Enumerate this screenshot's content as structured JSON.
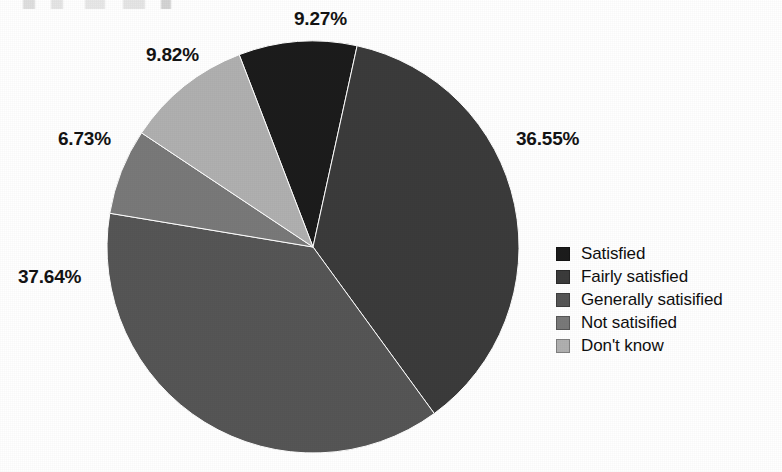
{
  "chart_data": {
    "type": "pie",
    "title": "",
    "subtitle": "",
    "xlabel": "",
    "ylabel": "",
    "grid": false,
    "legend_position": "right",
    "start_angle_deg": -21,
    "direction": "clockwise",
    "categories": [
      "Satisfied",
      "Fairly satisfied",
      "Generally satisified",
      "Not satisified",
      "Don't know"
    ],
    "values": [
      9.27,
      36.55,
      37.64,
      6.73,
      9.82
    ],
    "value_unit": "%",
    "data_labels": [
      "9.27%",
      "36.55%",
      "37.64%",
      "6.73%",
      "9.82%"
    ],
    "colors": [
      "#1c1c1c",
      "#3b3b3b",
      "#565656",
      "#797979",
      "#b0b0b0"
    ],
    "slices": [
      {
        "label": "Satisfied",
        "value": 9.27,
        "display": "9.27%",
        "color": "#1c1c1c"
      },
      {
        "label": "Fairly satisfied",
        "value": 36.55,
        "display": "36.55%",
        "color": "#3b3b3b"
      },
      {
        "label": "Generally satisified",
        "value": 37.64,
        "display": "37.64%",
        "color": "#565656"
      },
      {
        "label": "Not satisified",
        "value": 6.73,
        "display": "6.73%",
        "color": "#797979"
      },
      {
        "label": "Don't know",
        "value": 9.82,
        "display": "9.82%",
        "color": "#b0b0b0"
      }
    ]
  },
  "labels": {
    "satisfied_pct": "9.27%",
    "fairly_satisfied_pct": "36.55%",
    "generally_satisified_pct": "37.64%",
    "not_satisified_pct": "6.73%",
    "dont_know_pct": "9.82%"
  },
  "legend": {
    "items": [
      {
        "label": "Satisfied",
        "color": "#1c1c1c"
      },
      {
        "label": "Fairly satisfied",
        "color": "#3b3b3b"
      },
      {
        "label": "Generally satisified",
        "color": "#565656"
      },
      {
        "label": "Not satisified",
        "color": "#797979"
      },
      {
        "label": "Don't know",
        "color": "#b0b0b0"
      }
    ]
  }
}
